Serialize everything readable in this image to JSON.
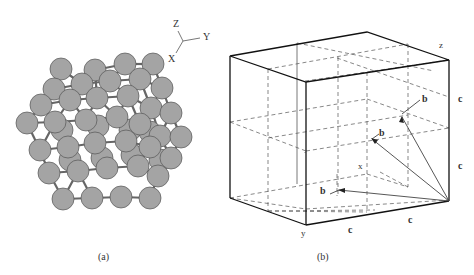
{
  "panel_a": {
    "caption": "(a)",
    "axes": {
      "z": "Z",
      "y": "Y",
      "x": "X"
    },
    "atom_color": "#a4a4a4",
    "atom_stroke": "#555555",
    "atoms": [
      [
        61,
        69
      ],
      [
        95,
        70
      ],
      [
        125,
        64
      ],
      [
        153,
        64
      ],
      [
        54,
        89
      ],
      [
        82,
        84
      ],
      [
        110,
        81
      ],
      [
        140,
        79
      ],
      [
        162,
        88
      ],
      [
        41,
        105
      ],
      [
        70,
        100
      ],
      [
        97,
        98
      ],
      [
        128,
        96
      ],
      [
        151,
        108
      ],
      [
        171,
        113
      ],
      [
        27,
        123
      ],
      [
        55,
        122
      ],
      [
        86,
        120
      ],
      [
        117,
        117
      ],
      [
        140,
        124
      ],
      [
        160,
        136
      ],
      [
        181,
        137
      ],
      [
        40,
        150
      ],
      [
        68,
        147
      ],
      [
        95,
        143
      ],
      [
        126,
        141
      ],
      [
        150,
        147
      ],
      [
        171,
        158
      ],
      [
        49,
        173
      ],
      [
        78,
        171
      ],
      [
        107,
        168
      ],
      [
        138,
        166
      ],
      [
        158,
        176
      ],
      [
        63,
        199
      ],
      [
        92,
        198
      ],
      [
        121,
        197
      ],
      [
        150,
        198
      ]
    ],
    "back_atoms": [
      [
        70,
        160
      ],
      [
        102,
        158
      ],
      [
        132,
        155
      ],
      [
        160,
        160
      ],
      [
        98,
        126
      ],
      [
        130,
        130
      ],
      [
        150,
        132
      ],
      [
        62,
        130
      ]
    ]
  },
  "panel_b": {
    "caption": "(b)",
    "axis_labels": {
      "z": "z",
      "x": "x",
      "y": "y"
    },
    "edge_labels": [
      "c",
      "c",
      "c",
      "c"
    ],
    "vector_labels": [
      "b",
      "b",
      "b"
    ]
  }
}
